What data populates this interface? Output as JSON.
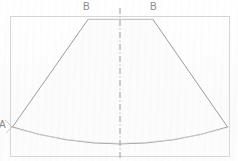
{
  "figure": {
    "background_color": "#fefefe",
    "line_color": "#9a9a9a",
    "frame_color": "#d2d2d2",
    "centerline_color": "#9a9a9a",
    "label_color": "#8a8a8a"
  },
  "labels": {
    "b_left": "B",
    "b_right": "B",
    "a_left": "A"
  },
  "geometry": {
    "frame": {
      "x": 10,
      "y": 16,
      "width": 220,
      "height": 141
    },
    "centerline": {
      "x": 120,
      "y_top": 8,
      "y_bottom": 159,
      "style": "dash-dot"
    },
    "vertex_b_left": {
      "x": 88,
      "y": 19
    },
    "vertex_b_right": {
      "x": 153,
      "y": 19
    },
    "vertex_a_left": {
      "x": 12,
      "y": 127
    },
    "vertex_a_right": {
      "x": 228,
      "y": 127
    },
    "arc_bottom_apex": {
      "x": 120,
      "y": 152
    },
    "top_chord": {
      "x1": 88,
      "y1": 19,
      "x2": 153,
      "y2": 19
    }
  }
}
